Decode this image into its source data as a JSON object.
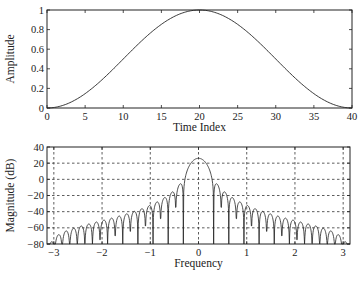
{
  "chart_data": [
    {
      "type": "line",
      "title": "",
      "xlabel": "Time Index",
      "ylabel": "Amplitude",
      "xlim": [
        0,
        40
      ],
      "ylim": [
        0,
        1
      ],
      "xticks": [
        0,
        5,
        10,
        15,
        20,
        25,
        30,
        35,
        40
      ],
      "yticks": [
        0,
        0.2,
        0.4,
        0.6,
        0.8,
        1
      ],
      "ytick_labels": [
        "0",
        "0.2",
        "0.4",
        "0.6",
        "0.8",
        "1"
      ],
      "grid": false,
      "legend": null,
      "series": [
        {
          "name": "Hann window (N=41)",
          "x": [
            0,
            1,
            2,
            3,
            4,
            5,
            6,
            7,
            8,
            9,
            10,
            11,
            12,
            13,
            14,
            15,
            16,
            17,
            18,
            19,
            20,
            21,
            22,
            23,
            24,
            25,
            26,
            27,
            28,
            29,
            30,
            31,
            32,
            33,
            34,
            35,
            36,
            37,
            38,
            39,
            40
          ],
          "values": [
            0.0,
            0.006,
            0.024,
            0.054,
            0.095,
            0.146,
            0.206,
            0.273,
            0.345,
            0.422,
            0.5,
            0.578,
            0.655,
            0.727,
            0.794,
            0.854,
            0.905,
            0.946,
            0.976,
            0.994,
            1.0,
            0.994,
            0.976,
            0.946,
            0.905,
            0.854,
            0.794,
            0.727,
            0.655,
            0.578,
            0.5,
            0.422,
            0.345,
            0.273,
            0.206,
            0.146,
            0.095,
            0.054,
            0.024,
            0.006,
            0.0
          ]
        }
      ]
    },
    {
      "type": "line",
      "title": "",
      "xlabel": "Frequency",
      "ylabel": "Magnitude (dB)",
      "xlim": [
        -3.1416,
        3.1416
      ],
      "ylim": [
        -80,
        40
      ],
      "xticks": [
        -3,
        -2,
        -1,
        0,
        1,
        2,
        3
      ],
      "yticks": [
        -80,
        -60,
        -40,
        -20,
        0,
        20,
        40
      ],
      "grid": true,
      "grid_style": "dashed",
      "legend": null,
      "series": [
        {
          "name": "Magnitude spectrum of Hann window",
          "peak_x": 0,
          "peak_db": 26,
          "envelope_points": [
            {
              "x": -3.0,
              "db": -72
            },
            {
              "x": -2.0,
              "db": -58
            },
            {
              "x": -1.0,
              "db": -40
            },
            {
              "x": -0.5,
              "db": -25
            },
            {
              "x": -0.2,
              "db": 10
            },
            {
              "x": 0.0,
              "db": 26
            },
            {
              "x": 0.2,
              "db": 10
            },
            {
              "x": 0.5,
              "db": -25
            },
            {
              "x": 1.0,
              "db": -40
            },
            {
              "x": 2.0,
              "db": -58
            },
            {
              "x": 3.0,
              "db": -72
            }
          ]
        }
      ]
    }
  ]
}
